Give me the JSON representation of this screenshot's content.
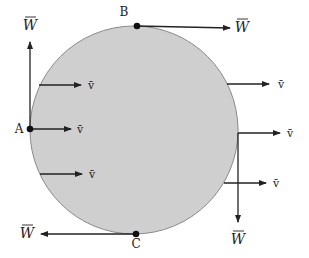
{
  "diagram": {
    "title": "",
    "disk": {
      "cx": 134,
      "cy": 130,
      "r": 104,
      "fill": "#cfcfcf",
      "stroke": "#8a8a8a"
    },
    "points": [
      {
        "id": "A",
        "label": "A",
        "x": 30,
        "y": 129
      },
      {
        "id": "B",
        "label": "B",
        "x": 137,
        "y": 26
      },
      {
        "id": "C",
        "label": "C",
        "x": 136,
        "y": 234
      }
    ],
    "velocity_label": "v̄",
    "w_label": "W",
    "arrows": [
      {
        "name": "w-arrow-a-up",
        "from": [
          30,
          129
        ],
        "to": [
          30,
          42
        ],
        "label": "W",
        "lx": 30,
        "ly": 30
      },
      {
        "name": "w-arrow-b-right",
        "from": [
          137,
          26
        ],
        "to": [
          230,
          28
        ],
        "label": "W",
        "lx": 242,
        "ly": 32
      },
      {
        "name": "w-arrow-c-left",
        "from": [
          136,
          234
        ],
        "to": [
          41,
          234
        ],
        "label": "W",
        "lx": 27,
        "ly": 238
      },
      {
        "name": "w-arrow-right-down",
        "from": [
          238,
          133
        ],
        "to": [
          238,
          222
        ],
        "label": "W",
        "lx": 238,
        "ly": 244
      },
      {
        "name": "v-arrow-left-top",
        "from": [
          39,
          85
        ],
        "to": [
          81,
          85
        ],
        "label": "v̄",
        "lx": 91,
        "ly": 89
      },
      {
        "name": "v-arrow-a",
        "from": [
          30,
          129
        ],
        "to": [
          71,
          129
        ],
        "label": "v̄",
        "lx": 80,
        "ly": 133
      },
      {
        "name": "v-arrow-left-bottom",
        "from": [
          40,
          174
        ],
        "to": [
          82,
          174
        ],
        "label": "v̄",
        "lx": 92,
        "ly": 178
      },
      {
        "name": "v-arrow-right-top",
        "from": [
          227,
          84
        ],
        "to": [
          269,
          84
        ],
        "label": "v̄",
        "lx": 281,
        "ly": 88
      },
      {
        "name": "v-arrow-right-mid",
        "from": [
          238,
          133
        ],
        "to": [
          280,
          133
        ],
        "label": "v̄",
        "lx": 290,
        "ly": 137
      },
      {
        "name": "v-arrow-right-bottom",
        "from": [
          224,
          183
        ],
        "to": [
          266,
          183
        ],
        "label": "v̄",
        "lx": 276,
        "ly": 187
      }
    ]
  }
}
